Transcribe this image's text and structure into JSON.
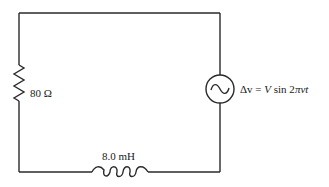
{
  "diagram": {
    "type": "series RL circuit with AC source",
    "resistor": {
      "label": "80 Ω",
      "value": 80,
      "unit": "Ω"
    },
    "inductor": {
      "label": "8.0 mH",
      "value": 8.0,
      "unit": "mH"
    },
    "source": {
      "label_lhs": "Δv",
      "label_eq": " = ",
      "label_V": "V",
      "label_sin": " sin 2",
      "label_pi": "π",
      "label_nu": "ν",
      "label_t": "t",
      "full_label": "Δv = V sin 2πνt",
      "icon": "ac-source-sine-icon"
    },
    "colors": {
      "line": "#2a2a2a",
      "text": "#1a1a1a",
      "background": "#ffffff"
    }
  }
}
